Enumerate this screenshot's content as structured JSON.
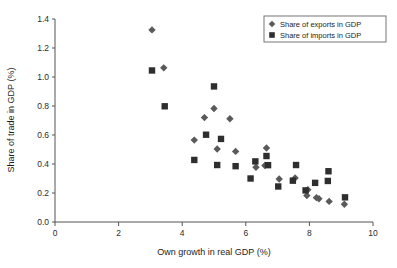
{
  "chart_data": {
    "type": "scatter",
    "title": "",
    "xlabel": "Own growth in real GDP (%)",
    "ylabel": "Share of trade in GDP (%)",
    "xlim": [
      0,
      10
    ],
    "ylim": [
      0.0,
      1.4
    ],
    "xticks": [
      0,
      2,
      4,
      6,
      8,
      10
    ],
    "xtick_labels": [
      "0",
      "2",
      "4",
      "6",
      "8",
      "10"
    ],
    "yticks": [
      0.0,
      0.2,
      0.4,
      0.6,
      0.8,
      1.0,
      1.2,
      1.4
    ],
    "ytick_labels": [
      "0.0",
      "0.2",
      "0.4",
      "0.6",
      "0.8",
      "1.0",
      "1.2",
      "1.4"
    ],
    "grid": false,
    "legend_position": "top-right",
    "series": [
      {
        "name": "Share of exports in GDP",
        "marker": "diamond",
        "color": "#5a5a5a",
        "points": [
          [
            3.05,
            1.325
          ],
          [
            3.42,
            1.063
          ],
          [
            4.7,
            0.72
          ],
          [
            5.0,
            0.783
          ],
          [
            5.5,
            0.712
          ],
          [
            4.38,
            0.565
          ],
          [
            5.1,
            0.503
          ],
          [
            5.68,
            0.487
          ],
          [
            6.65,
            0.51
          ],
          [
            6.32,
            0.378
          ],
          [
            6.6,
            0.39
          ],
          [
            7.05,
            0.297
          ],
          [
            7.55,
            0.303
          ],
          [
            7.92,
            0.182
          ],
          [
            7.95,
            0.222
          ],
          [
            8.22,
            0.168
          ],
          [
            8.3,
            0.16
          ],
          [
            8.62,
            0.142
          ],
          [
            9.1,
            0.122
          ]
        ]
      },
      {
        "name": "Share of imports in GDP",
        "marker": "square",
        "color": "#2e2e2e",
        "points": [
          [
            3.05,
            1.045
          ],
          [
            3.45,
            0.798
          ],
          [
            5.0,
            0.935
          ],
          [
            4.75,
            0.602
          ],
          [
            5.22,
            0.573
          ],
          [
            4.38,
            0.428
          ],
          [
            5.1,
            0.393
          ],
          [
            5.68,
            0.385
          ],
          [
            6.3,
            0.418
          ],
          [
            6.65,
            0.455
          ],
          [
            6.7,
            0.392
          ],
          [
            6.15,
            0.3
          ],
          [
            7.02,
            0.245
          ],
          [
            7.48,
            0.285
          ],
          [
            7.58,
            0.393
          ],
          [
            7.88,
            0.218
          ],
          [
            8.18,
            0.27
          ],
          [
            8.58,
            0.283
          ],
          [
            8.6,
            0.35
          ],
          [
            9.12,
            0.17
          ]
        ]
      }
    ]
  },
  "legend": {
    "items": [
      {
        "label": "Share of exports in GDP",
        "marker": "diamond"
      },
      {
        "label": "Share of imports in GDP",
        "marker": "square"
      }
    ]
  }
}
